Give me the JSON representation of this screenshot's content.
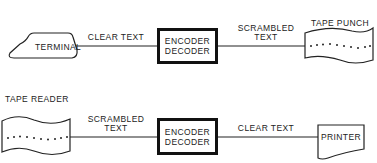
{
  "diagram": {
    "top_row": {
      "source": {
        "label": "TERMINAL",
        "shape": "terminal"
      },
      "link1": {
        "label": "CLEAR TEXT"
      },
      "processor": {
        "line1": "ENCODER",
        "line2": "DECODER"
      },
      "link2": {
        "label_line1": "SCRAMBLED",
        "label_line2": "TEXT"
      },
      "sink": {
        "label": "TAPE PUNCH",
        "shape": "punched-tape"
      }
    },
    "bottom_row": {
      "source": {
        "label": "TAPE READER",
        "shape": "punched-tape"
      },
      "link1": {
        "label_line1": "SCRAMBLED",
        "label_line2": "TEXT"
      },
      "processor": {
        "line1": "ENCODER",
        "line2": "DECODER"
      },
      "link2": {
        "label": "CLEAR TEXT"
      },
      "sink": {
        "label": "PRINTER",
        "shape": "document"
      }
    }
  }
}
